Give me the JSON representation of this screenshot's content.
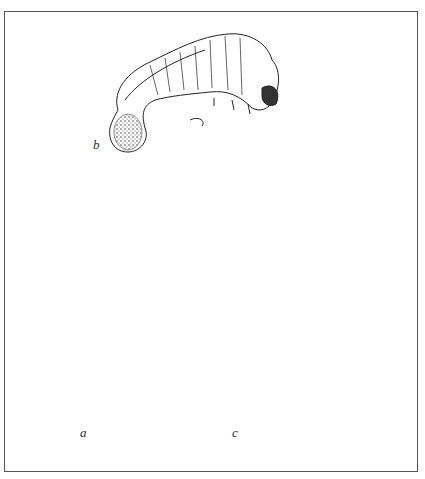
{
  "figure": {
    "labels": {
      "larva": "b",
      "small_beetle": "a",
      "large_beetle": "c"
    },
    "colors": {
      "ink": "#111111",
      "paper": "#ffffff",
      "border": "#555555"
    }
  }
}
